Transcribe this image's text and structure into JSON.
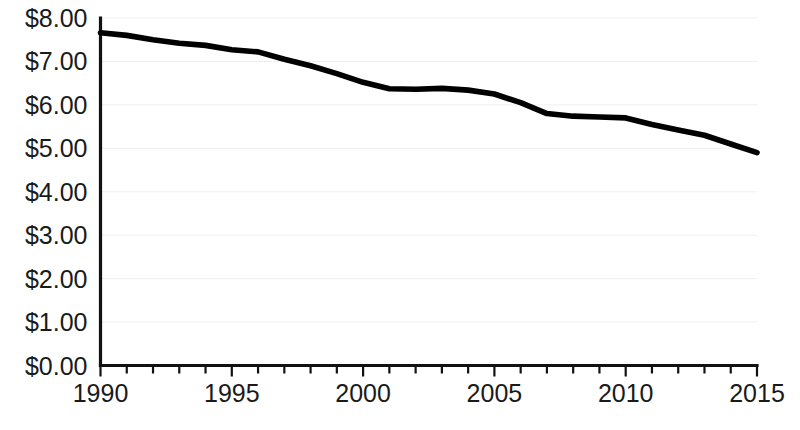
{
  "chart_data": {
    "type": "line",
    "title": "",
    "subtitle": "",
    "xlabel": "",
    "ylabel": "",
    "xlim": [
      1990,
      2015
    ],
    "ylim": [
      0,
      8
    ],
    "grid": true,
    "legend": false,
    "legend_position": "none",
    "line_color": "#000000",
    "gridline_color": "#efefef",
    "axis_color": "#111111",
    "background_color": "#ffffff",
    "y_tick_values": [
      0,
      1,
      2,
      3,
      4,
      5,
      6,
      7,
      8
    ],
    "y_tick_labels": [
      "$0.00",
      "$1.00",
      "$2.00",
      "$3.00",
      "$4.00",
      "$5.00",
      "$6.00",
      "$7.00",
      "$8.00"
    ],
    "x_tick_values": [
      1990,
      1991,
      1992,
      1993,
      1994,
      1995,
      1996,
      1997,
      1998,
      1999,
      2000,
      2001,
      2002,
      2003,
      2004,
      2005,
      2006,
      2007,
      2008,
      2009,
      2010,
      2011,
      2012,
      2013,
      2014,
      2015
    ],
    "x_tick_labels_shown": [
      "1990",
      "1995",
      "2000",
      "2005",
      "2010",
      "2015"
    ],
    "x_labeled_values": [
      1990,
      1995,
      2000,
      2005,
      2010,
      2015
    ],
    "x": [
      1990,
      1991,
      1992,
      1993,
      1994,
      1995,
      1996,
      1997,
      1998,
      1999,
      2000,
      2001,
      2002,
      2003,
      2004,
      2005,
      2006,
      2007,
      2008,
      2009,
      2010,
      2011,
      2012,
      2013,
      2014,
      2015
    ],
    "values": [
      7.66,
      7.6,
      7.5,
      7.42,
      7.37,
      7.27,
      7.22,
      7.05,
      6.9,
      6.72,
      6.52,
      6.37,
      6.36,
      6.38,
      6.34,
      6.25,
      6.05,
      5.8,
      5.74,
      5.72,
      5.7,
      5.55,
      5.42,
      5.3,
      5.1,
      4.9
    ],
    "series": [
      {
        "name": "value",
        "values": [
          7.66,
          7.6,
          7.5,
          7.42,
          7.37,
          7.27,
          7.22,
          7.05,
          6.9,
          6.72,
          6.52,
          6.37,
          6.36,
          6.38,
          6.34,
          6.25,
          6.05,
          5.8,
          5.74,
          5.72,
          5.7,
          5.55,
          5.42,
          5.3,
          5.1,
          4.9
        ]
      }
    ]
  }
}
